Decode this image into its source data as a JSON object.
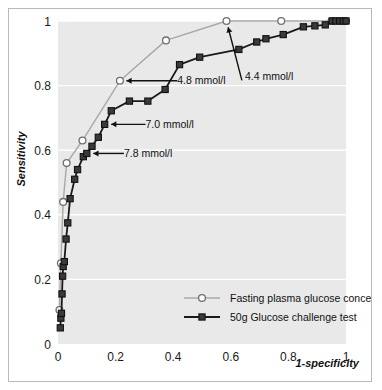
{
  "chart_data": {
    "type": "line",
    "title": "",
    "xlabel": "1-specificity",
    "ylabel": "Sensitivity",
    "xlim": [
      0,
      1
    ],
    "ylim": [
      0,
      1
    ],
    "xticks": [
      "0",
      "0.2",
      "0.4",
      "0.6",
      "0.8",
      "1"
    ],
    "xtick_values": [
      0,
      0.2,
      0.4,
      0.6,
      0.8,
      1
    ],
    "yticks": [
      "0",
      "0.2",
      "0.4",
      "0.6",
      "0.8",
      "1"
    ],
    "ytick_values": [
      0,
      0.2,
      0.4,
      0.6,
      0.8,
      1
    ],
    "grid": "horizontal",
    "plot_bg": "#e9e9e9",
    "gridline_color": "#ffffff",
    "legend_position": "lower-right-inside",
    "series": [
      {
        "name": "Fasting plasma glucose concentration",
        "color": "#a8a8a8",
        "marker": "open-circle",
        "marker_fill": "#ffffff",
        "points": [
          [
            0.005,
            0.105
          ],
          [
            0.01,
            0.25
          ],
          [
            0.018,
            0.44
          ],
          [
            0.03,
            0.56
          ],
          [
            0.085,
            0.63
          ],
          [
            0.215,
            0.815
          ],
          [
            0.375,
            0.94
          ],
          [
            0.585,
            1.0
          ],
          [
            0.775,
            1.0
          ],
          [
            0.95,
            1.0
          ],
          [
            1.0,
            1.0
          ]
        ]
      },
      {
        "name": "50g Glucose challenge test",
        "color": "#1a1a1a",
        "marker": "filled-square",
        "marker_fill": "#3a3a3a",
        "points": [
          [
            0.008,
            0.05
          ],
          [
            0.01,
            0.08
          ],
          [
            0.012,
            0.095
          ],
          [
            0.014,
            0.155
          ],
          [
            0.016,
            0.21
          ],
          [
            0.018,
            0.24
          ],
          [
            0.022,
            0.255
          ],
          [
            0.028,
            0.325
          ],
          [
            0.034,
            0.375
          ],
          [
            0.042,
            0.45
          ],
          [
            0.058,
            0.51
          ],
          [
            0.068,
            0.54
          ],
          [
            0.088,
            0.58
          ],
          [
            0.1,
            0.59
          ],
          [
            0.118,
            0.612
          ],
          [
            0.14,
            0.64
          ],
          [
            0.162,
            0.68
          ],
          [
            0.185,
            0.722
          ],
          [
            0.248,
            0.752
          ],
          [
            0.312,
            0.752
          ],
          [
            0.372,
            0.788
          ],
          [
            0.422,
            0.865
          ],
          [
            0.492,
            0.888
          ],
          [
            0.628,
            0.912
          ],
          [
            0.69,
            0.935
          ],
          [
            0.722,
            0.945
          ],
          [
            0.782,
            0.958
          ],
          [
            0.852,
            0.982
          ],
          [
            0.892,
            0.985
          ],
          [
            0.928,
            0.988
          ],
          [
            0.952,
            1.0
          ],
          [
            0.965,
            1.0
          ],
          [
            0.978,
            1.0
          ],
          [
            0.99,
            1.0
          ],
          [
            1.0,
            1.0
          ]
        ]
      }
    ],
    "annotations": [
      {
        "label": "4.4 mmol/l",
        "text_x": 0.635,
        "text_y": 0.828,
        "point_x": 0.585,
        "point_y": 1.0,
        "anchor": "start"
      },
      {
        "label": "4.8 mmol/l",
        "text_x": 0.4,
        "text_y": 0.815,
        "point_x": 0.215,
        "point_y": 0.815,
        "anchor": "start"
      },
      {
        "label": "7.0 mmol/l",
        "text_x": 0.29,
        "text_y": 0.68,
        "point_x": 0.162,
        "point_y": 0.68,
        "anchor": "start"
      },
      {
        "label": "7.8 mmol/l",
        "text_x": 0.215,
        "text_y": 0.59,
        "point_x": 0.1,
        "point_y": 0.59,
        "anchor": "start"
      }
    ],
    "legend": [
      {
        "label": "Fasting plasma glucose concentration",
        "color": "#a8a8a8",
        "marker": "open-circle"
      },
      {
        "label": "50g Glucose challenge test",
        "color": "#1a1a1a",
        "marker": "filled-square"
      }
    ]
  }
}
